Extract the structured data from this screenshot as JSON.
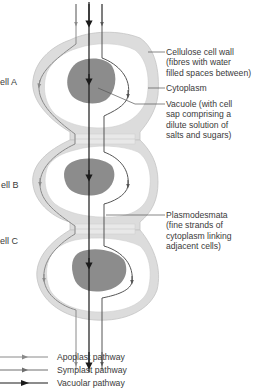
{
  "cells": [
    {
      "label": "ell A"
    },
    {
      "label": "ell B"
    },
    {
      "label": "ell C"
    }
  ],
  "annotations": [
    {
      "id": "cell-wall",
      "text": "Cellulose cell wall\n(fibres with water\nfilled spaces between)"
    },
    {
      "id": "cytoplasm",
      "text": "Cytoplasm"
    },
    {
      "id": "vacuole",
      "text": "Vacuole (with cell\nsap comprising a\ndilute solution of\nsalts and sugars)"
    },
    {
      "id": "plasmodesmata",
      "text": "Plasmodesmata\n(fine strands of\ncytoplasm linking\nadjacent cells)"
    }
  ],
  "legend": [
    {
      "label": "Apoplast pathway",
      "color": "#8a8a8a"
    },
    {
      "label": "Symplast pathway",
      "color": "#6e6e6e"
    },
    {
      "label": "Vacuolar pathway",
      "color": "#1a1a1a"
    }
  ],
  "colors": {
    "wall": "#dcdcdc",
    "wall_stroke": "#c4c4c4",
    "cytoplasm": "#ffffff",
    "vacuole": "#8c8c8c",
    "apoplast": "#8a8a8a",
    "symplast": "#555555",
    "vacuolar": "#1a1a1a",
    "leader": "#555555"
  }
}
